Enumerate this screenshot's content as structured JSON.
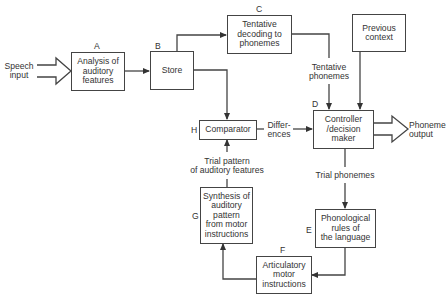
{
  "diagram": {
    "inputs": {
      "speech_input": "Speech\ninput",
      "previous_context": "Previous\ncontext"
    },
    "nodes": [
      {
        "id": "A",
        "letter": "A",
        "label": "Analysis of\nauditory\nfeatures"
      },
      {
        "id": "B",
        "letter": "B",
        "label": "Store"
      },
      {
        "id": "C",
        "letter": "C",
        "label": "Tentative\ndecoding to\nphonemes"
      },
      {
        "id": "D",
        "letter": "D",
        "label": "Controller\n/decision\nmaker"
      },
      {
        "id": "E",
        "letter": "E",
        "label": "Phonological\nrules of\nthe language"
      },
      {
        "id": "F",
        "letter": "F",
        "label": "Articulatory\nmotor\ninstructions"
      },
      {
        "id": "G",
        "letter": "G",
        "label": "Synthesis of\nauditory\npattern\nfrom motor\ninstructions"
      },
      {
        "id": "H",
        "letter": "H",
        "label": "Comparator"
      }
    ],
    "edge_labels": {
      "tentative_phonemes": "Tentative\nphonemes",
      "differences": "Differ-\nences",
      "trial_pattern": "Trial pattern\nof auditory features",
      "trial_phonemes": "Trial phonemes"
    },
    "outputs": {
      "phoneme_output": "Phoneme\noutput"
    },
    "edges": [
      {
        "from": "Speech input",
        "to": "A",
        "style": "hollow-arrow"
      },
      {
        "from": "A",
        "to": "B"
      },
      {
        "from": "B",
        "to": "C"
      },
      {
        "from": "B",
        "to": "H"
      },
      {
        "from": "C",
        "to": "D",
        "label": "Tentative phonemes"
      },
      {
        "from": "Previous context",
        "to": "D"
      },
      {
        "from": "H",
        "to": "D",
        "label": "Differences"
      },
      {
        "from": "D",
        "to": "Phoneme output",
        "style": "hollow-arrow"
      },
      {
        "from": "D",
        "to": "E",
        "label": "Trial phonemes"
      },
      {
        "from": "E",
        "to": "F"
      },
      {
        "from": "F",
        "to": "G"
      },
      {
        "from": "G",
        "to": "H",
        "label": "Trial pattern of auditory features"
      }
    ]
  }
}
